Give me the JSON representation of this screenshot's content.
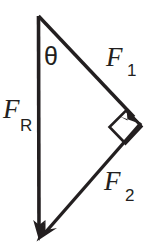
{
  "figure": {
    "name": "force-triangle-vector-diagram",
    "background_color": "#ffffff",
    "stroke_color": "#231f20",
    "width": 159,
    "height": 252
  },
  "labels": {
    "resultant": {
      "symbol": "F",
      "subscript": "R"
    },
    "force_one": {
      "symbol": "F",
      "subscript": "1"
    },
    "force_two": {
      "symbol": "F",
      "subscript": "2"
    },
    "angle": {
      "symbol": "θ"
    }
  },
  "geometry": {
    "apex": {
      "x": 38,
      "y": 16
    },
    "bottom_vertex": {
      "x": 39,
      "y": 240
    },
    "right_vertex": {
      "x": 141,
      "y": 123
    },
    "right_angle_marker": {
      "x": 126,
      "y": 127,
      "size": 21
    }
  },
  "vectors": [
    {
      "name": "F_R",
      "from": "apex",
      "to": "bottom_vertex",
      "arrowhead": "end"
    },
    {
      "name": "F_1",
      "from": "apex",
      "to": "right_vertex",
      "arrowhead": "end"
    },
    {
      "name": "F_2",
      "from": "right_vertex",
      "to": "bottom_vertex",
      "arrowhead": "end"
    }
  ]
}
